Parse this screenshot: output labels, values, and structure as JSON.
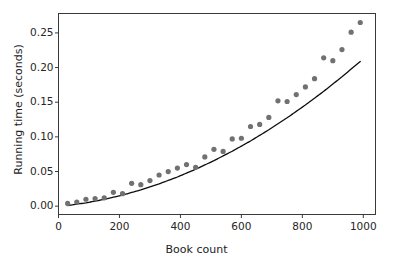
{
  "chart_data": {
    "type": "scatter",
    "title": "",
    "xlabel": "Book count",
    "ylabel": "Running time (seconds)",
    "xlim": [
      0,
      1040
    ],
    "ylim": [
      -0.012,
      0.278
    ],
    "xticks": [
      0,
      200,
      400,
      600,
      800,
      1000
    ],
    "xtick_labels": [
      "0",
      "200",
      "400",
      "600",
      "800",
      "1000"
    ],
    "yticks": [
      0.0,
      0.05,
      0.1,
      0.15,
      0.2,
      0.25
    ],
    "ytick_labels": [
      "0.00",
      "0.05",
      "0.10",
      "0.15",
      "0.20",
      "0.25"
    ],
    "grid": false,
    "legend": null,
    "marker_color": "#717171",
    "marker_size": 5.2,
    "line_color": "#0d0d0d",
    "line_width": 1.3,
    "spine_color": "#3a3a3a",
    "series": [
      {
        "name": "measured running time",
        "type": "scatter",
        "x": [
          30,
          60,
          90,
          120,
          150,
          180,
          210,
          240,
          270,
          300,
          330,
          360,
          390,
          420,
          450,
          480,
          510,
          540,
          570,
          600,
          630,
          660,
          690,
          720,
          750,
          780,
          810,
          840,
          870,
          900,
          930,
          960,
          990
        ],
        "y": [
          0.004,
          0.006,
          0.01,
          0.011,
          0.012,
          0.02,
          0.018,
          0.033,
          0.031,
          0.037,
          0.045,
          0.05,
          0.055,
          0.06,
          0.056,
          0.071,
          0.082,
          0.079,
          0.097,
          0.098,
          0.115,
          0.118,
          0.128,
          0.152,
          0.151,
          0.161,
          0.172,
          0.184,
          0.214,
          0.21,
          0.226,
          0.251,
          0.265
        ]
      },
      {
        "name": "fitted quadratic curve",
        "type": "line",
        "x": [
          30,
          90,
          150,
          210,
          270,
          330,
          390,
          450,
          510,
          570,
          630,
          690,
          750,
          810,
          870,
          930,
          990
        ],
        "y": [
          0.001,
          0.0048,
          0.0098,
          0.016,
          0.0235,
          0.0322,
          0.0421,
          0.0533,
          0.0657,
          0.0793,
          0.0941,
          0.1102,
          0.1275,
          0.146,
          0.1657,
          0.1867,
          0.2089
        ]
      }
    ]
  }
}
